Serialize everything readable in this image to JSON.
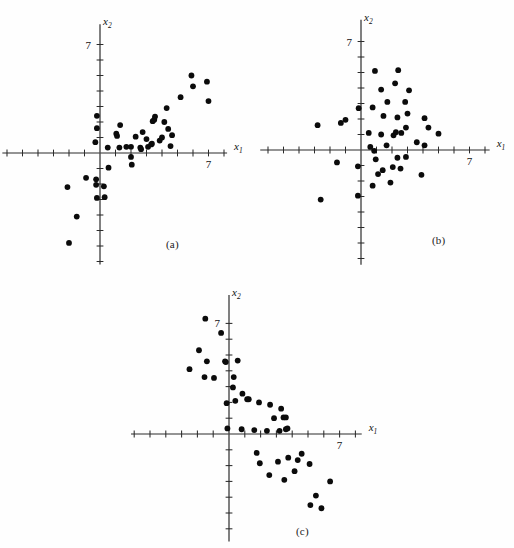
{
  "figure": {
    "background_color": "#fefefe",
    "point_color": "#0b0b0b",
    "axis_color": "#2b2b2b",
    "panels": [
      {
        "caption": "(a)"
      },
      {
        "caption": "(b)"
      },
      {
        "caption": "(c)"
      }
    ]
  },
  "chart_data": [
    {
      "type": "scatter",
      "title": "(a)",
      "xlabel": "x₁",
      "ylabel": "x₂",
      "grid": false,
      "legend": null,
      "annotations": [
        "positive correlation"
      ],
      "xlim": [
        -6.2,
        9.0
      ],
      "ylim": [
        -7.6,
        8.2
      ],
      "xticks": [
        -6,
        -5,
        -4,
        -3,
        -2,
        -1,
        1,
        2,
        3,
        4,
        5,
        6,
        7,
        8
      ],
      "yticks": [
        -7,
        -6,
        -5,
        -4,
        -3,
        -2,
        -1,
        1,
        2,
        3,
        4,
        5,
        6,
        7
      ],
      "xtick_labels": {
        "7": "7"
      },
      "ytick_labels": {
        "7": "7"
      },
      "points": [
        [
          -0.2,
          2.4
        ],
        [
          -0.2,
          1.6
        ],
        [
          -0.3,
          0.7
        ],
        [
          0.5,
          0.35
        ],
        [
          1.3,
          1.8
        ],
        [
          1.05,
          1.25
        ],
        [
          1.1,
          1.1
        ],
        [
          1.25,
          0.35
        ],
        [
          1.7,
          0.4
        ],
        [
          2.0,
          0.4
        ],
        [
          2.3,
          1.05
        ],
        [
          2.0,
          -0.25
        ],
        [
          2.6,
          0.35
        ],
        [
          2.65,
          0.25
        ],
        [
          2.75,
          1.35
        ],
        [
          3.0,
          0.9
        ],
        [
          3.1,
          0.4
        ],
        [
          3.3,
          0.55
        ],
        [
          3.35,
          0.6
        ],
        [
          3.4,
          2.05
        ],
        [
          3.5,
          2.15
        ],
        [
          3.55,
          2.35
        ],
        [
          3.85,
          0.8
        ],
        [
          4.0,
          1.0
        ],
        [
          4.15,
          2.0
        ],
        [
          4.3,
          2.9
        ],
        [
          4.4,
          1.55
        ],
        [
          4.55,
          0.45
        ],
        [
          4.65,
          1.15
        ],
        [
          5.2,
          3.6
        ],
        [
          5.9,
          5.0
        ],
        [
          6.0,
          4.3
        ],
        [
          6.9,
          4.6
        ],
        [
          7.0,
          3.35
        ],
        [
          0.55,
          -0.95
        ],
        [
          2.05,
          -0.75
        ],
        [
          -0.25,
          -1.7
        ],
        [
          -0.9,
          -1.6
        ],
        [
          -2.1,
          -2.2
        ],
        [
          0.25,
          -2.15
        ],
        [
          -0.25,
          -2.05
        ],
        [
          -0.2,
          -2.9
        ],
        [
          0.3,
          -2.85
        ],
        [
          -1.5,
          -4.1
        ],
        [
          -2.0,
          -5.8
        ]
      ]
    },
    {
      "type": "scatter",
      "title": "(b)",
      "xlabel": "x₁",
      "ylabel": "x₂",
      "grid": false,
      "legend": null,
      "annotations": [
        "no correlation"
      ],
      "xlim": [
        -6.4,
        9.0
      ],
      "ylim": [
        -7.8,
        8.2
      ],
      "xticks": [
        -6,
        -5,
        -4,
        -3,
        -2,
        -1,
        1,
        2,
        3,
        4,
        5,
        6,
        7,
        8
      ],
      "yticks": [
        -7,
        -6,
        -5,
        -4,
        -3,
        -2,
        -1,
        1,
        2,
        3,
        4,
        5,
        6,
        7
      ],
      "xtick_labels": {
        "7": "7"
      },
      "ytick_labels": {
        "7": "7"
      },
      "points": [
        [
          0.9,
          5.1
        ],
        [
          2.4,
          5.15
        ],
        [
          1.3,
          3.9
        ],
        [
          2.2,
          4.3
        ],
        [
          3.1,
          3.85
        ],
        [
          2.85,
          3.1
        ],
        [
          1.7,
          3.1
        ],
        [
          0.75,
          2.75
        ],
        [
          -0.15,
          2.7
        ],
        [
          3.0,
          2.35
        ],
        [
          1.45,
          2.2
        ],
        [
          2.35,
          2.1
        ],
        [
          -1.0,
          1.95
        ],
        [
          4.1,
          2.05
        ],
        [
          4.35,
          1.45
        ],
        [
          2.9,
          1.45
        ],
        [
          -2.8,
          1.6
        ],
        [
          -1.3,
          1.75
        ],
        [
          0.5,
          1.1
        ],
        [
          1.3,
          1.0
        ],
        [
          2.1,
          0.95
        ],
        [
          2.6,
          1.1
        ],
        [
          2.25,
          1.15
        ],
        [
          5.0,
          1.05
        ],
        [
          3.6,
          0.5
        ],
        [
          4.1,
          0.3
        ],
        [
          0.6,
          0.2
        ],
        [
          1.65,
          0.3
        ],
        [
          0.85,
          -0.05
        ],
        [
          0.95,
          -0.6
        ],
        [
          2.35,
          -0.5
        ],
        [
          2.9,
          -0.45
        ],
        [
          -1.55,
          -0.8
        ],
        [
          1.4,
          -1.3
        ],
        [
          2.05,
          -1.1
        ],
        [
          1.1,
          -1.55
        ],
        [
          -0.2,
          -1.05
        ],
        [
          0.75,
          -2.3
        ],
        [
          1.9,
          -2.1
        ],
        [
          3.9,
          -1.6
        ],
        [
          2.55,
          -1.2
        ],
        [
          -0.2,
          -2.95
        ],
        [
          -2.6,
          -3.2
        ]
      ]
    },
    {
      "type": "scatter",
      "title": "(c)",
      "xlabel": "x₁",
      "ylabel": "x₂",
      "grid": false,
      "legend": null,
      "annotations": [
        "negative correlation"
      ],
      "xlim": [
        -6.2,
        9.0
      ],
      "ylim": [
        -7.6,
        8.6
      ],
      "xticks": [
        -6,
        -5,
        -4,
        -3,
        -2,
        -1,
        1,
        2,
        3,
        4,
        5,
        6,
        7,
        8
      ],
      "yticks": [
        -7,
        -6,
        -5,
        -4,
        -3,
        -2,
        -1,
        1,
        2,
        3,
        4,
        5,
        6,
        7
      ],
      "xtick_labels": {
        "7": "7"
      },
      "ytick_labels": {
        "7": "7"
      },
      "points": [
        [
          -1.5,
          7.3
        ],
        [
          -0.5,
          6.4
        ],
        [
          -1.9,
          5.3
        ],
        [
          -0.25,
          4.6
        ],
        [
          -0.2,
          4.55
        ],
        [
          0.55,
          4.65
        ],
        [
          -1.4,
          4.6
        ],
        [
          -2.5,
          4.1
        ],
        [
          -1.55,
          3.6
        ],
        [
          -0.95,
          3.55
        ],
        [
          0.3,
          3.6
        ],
        [
          0.25,
          2.95
        ],
        [
          0.85,
          2.55
        ],
        [
          1.25,
          2.2
        ],
        [
          0.4,
          2.1
        ],
        [
          1.15,
          2.2
        ],
        [
          1.9,
          2.0
        ],
        [
          -0.15,
          1.95
        ],
        [
          2.6,
          1.85
        ],
        [
          3.3,
          1.6
        ],
        [
          2.85,
          1.0
        ],
        [
          3.45,
          1.05
        ],
        [
          3.6,
          1.05
        ],
        [
          -0.1,
          0.35
        ],
        [
          0.8,
          0.3
        ],
        [
          1.6,
          0.25
        ],
        [
          2.4,
          0.2
        ],
        [
          3.2,
          0.2
        ],
        [
          3.6,
          0.3
        ],
        [
          3.7,
          0.35
        ],
        [
          1.75,
          -1.2
        ],
        [
          1.95,
          -1.85
        ],
        [
          3.1,
          -1.75
        ],
        [
          3.75,
          -1.5
        ],
        [
          4.6,
          -1.25
        ],
        [
          4.35,
          -1.65
        ],
        [
          5.1,
          -1.9
        ],
        [
          2.55,
          -2.6
        ],
        [
          3.5,
          -2.9
        ],
        [
          4.15,
          -2.35
        ],
        [
          6.4,
          -3.0
        ],
        [
          5.5,
          -3.9
        ],
        [
          5.15,
          -4.5
        ],
        [
          5.85,
          -4.7
        ]
      ]
    }
  ]
}
